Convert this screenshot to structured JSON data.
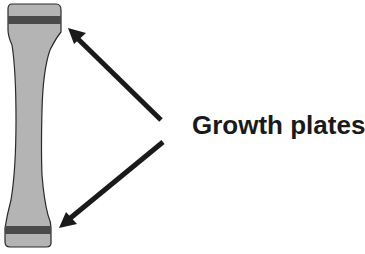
{
  "diagram": {
    "label": "Growth plates",
    "colors": {
      "bone_fill": "#b4b4b4",
      "bone_outline": "#2a2a2a",
      "growth_plate": "#4a4a4a",
      "arrow": "#1a1a1a",
      "text": "#1a1a1a",
      "background": "#ffffff"
    },
    "elements": [
      {
        "type": "bone",
        "name": "long-bone"
      },
      {
        "type": "band",
        "name": "upper-growth-plate"
      },
      {
        "type": "band",
        "name": "lower-growth-plate"
      },
      {
        "type": "arrow",
        "name": "arrow-to-upper-plate",
        "from": [
          161,
          120
        ],
        "to": [
          68,
          28
        ]
      },
      {
        "type": "arrow",
        "name": "arrow-to-lower-plate",
        "from": [
          163,
          142
        ],
        "to": [
          59,
          228
        ]
      }
    ]
  }
}
